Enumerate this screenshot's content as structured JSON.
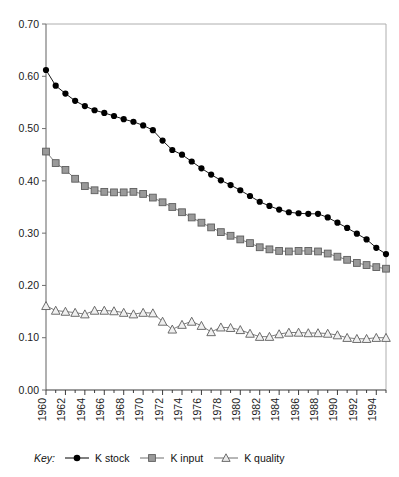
{
  "chart_data": {
    "type": "line",
    "title": "",
    "xlabel": "",
    "ylabel": "",
    "x": [
      1960,
      1961,
      1962,
      1963,
      1964,
      1965,
      1966,
      1967,
      1968,
      1969,
      1970,
      1971,
      1972,
      1973,
      1974,
      1975,
      1976,
      1977,
      1978,
      1979,
      1980,
      1981,
      1982,
      1983,
      1984,
      1985,
      1986,
      1987,
      1988,
      1989,
      1990,
      1991,
      1992,
      1993,
      1994,
      1995
    ],
    "xlim": [
      1960,
      1995
    ],
    "ylim": [
      0.0,
      0.7
    ],
    "yticks": [
      "0.00",
      "0.10",
      "0.20",
      "0.30",
      "0.40",
      "0.50",
      "0.60",
      "0.70"
    ],
    "xticks": [
      "1960",
      "1962",
      "1964",
      "1966",
      "1968",
      "1970",
      "1972",
      "1974",
      "1976",
      "1978",
      "1980",
      "1982",
      "1984",
      "1986",
      "1988",
      "1990",
      "1992",
      "1994"
    ],
    "grid": false,
    "legend_position": "bottom",
    "legend_prefix": "Key:",
    "series": [
      {
        "name": "K stock",
        "marker": "circle",
        "color": "#000000",
        "values": [
          0.612,
          0.582,
          0.567,
          0.553,
          0.543,
          0.535,
          0.53,
          0.524,
          0.518,
          0.513,
          0.506,
          0.497,
          0.477,
          0.459,
          0.45,
          0.437,
          0.424,
          0.412,
          0.401,
          0.392,
          0.382,
          0.371,
          0.36,
          0.352,
          0.345,
          0.34,
          0.338,
          0.337,
          0.337,
          0.33,
          0.32,
          0.31,
          0.299,
          0.288,
          0.272,
          0.26
        ]
      },
      {
        "name": "K input",
        "marker": "square",
        "color": "#9a9a9a",
        "values": [
          0.456,
          0.434,
          0.421,
          0.404,
          0.39,
          0.382,
          0.379,
          0.378,
          0.378,
          0.379,
          0.375,
          0.368,
          0.359,
          0.35,
          0.34,
          0.33,
          0.32,
          0.311,
          0.302,
          0.295,
          0.288,
          0.281,
          0.273,
          0.269,
          0.266,
          0.265,
          0.266,
          0.266,
          0.265,
          0.261,
          0.255,
          0.249,
          0.243,
          0.239,
          0.235,
          0.232
        ]
      },
      {
        "name": "K quality",
        "marker": "triangle",
        "color": "#9a9a9a",
        "values": [
          0.161,
          0.152,
          0.15,
          0.148,
          0.145,
          0.152,
          0.152,
          0.151,
          0.148,
          0.145,
          0.148,
          0.147,
          0.131,
          0.116,
          0.125,
          0.131,
          0.123,
          0.111,
          0.12,
          0.119,
          0.115,
          0.108,
          0.102,
          0.102,
          0.107,
          0.11,
          0.11,
          0.109,
          0.109,
          0.108,
          0.105,
          0.1,
          0.098,
          0.098,
          0.1,
          0.1
        ]
      }
    ]
  },
  "legend": {
    "key_label": "Key:",
    "items": [
      {
        "label": "K stock",
        "marker": "circle-marker",
        "color": "#000000"
      },
      {
        "label": "K input",
        "marker": "square-marker",
        "color": "#9a9a9a"
      },
      {
        "label": "K quality",
        "marker": "triangle-marker",
        "color": "#9a9a9a"
      }
    ]
  }
}
